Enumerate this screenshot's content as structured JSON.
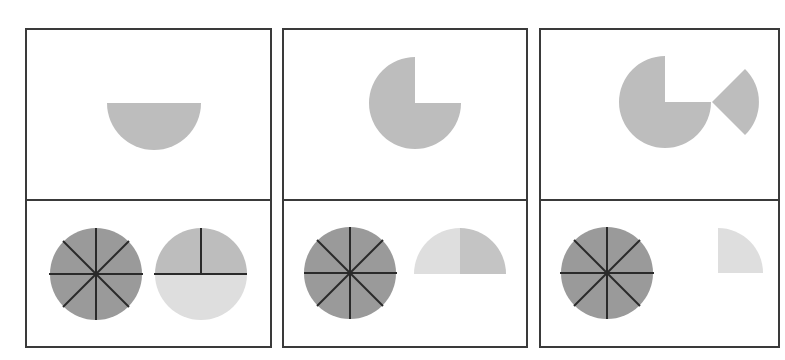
{
  "diagram": {
    "colors": {
      "background": "#ffffff",
      "border": "#3a3a3a",
      "dark_fill": "#9a9a9a",
      "medium_fill": "#bdbdbd",
      "light_fill": "#dedede",
      "line": "#2a2a2a"
    },
    "panels": [
      {
        "id": 1,
        "top": {
          "shape": "half-circle",
          "fraction": "1/2"
        },
        "bottom": [
          {
            "shape": "circle-eighths",
            "fraction": "8/8"
          },
          {
            "shape": "circle-split",
            "upper": "medium (two quarters)",
            "lower": "light half"
          }
        ]
      },
      {
        "id": 2,
        "top": {
          "shape": "three-quarter-circle",
          "fraction": "3/4"
        },
        "bottom": [
          {
            "shape": "circle-eighths",
            "fraction": "8/8"
          },
          {
            "shape": "half-circle-split",
            "left": "light quarter",
            "right": "medium quarter"
          }
        ]
      },
      {
        "id": 3,
        "top": {
          "shape": "three-quarter-circle-plus-quarter-wedge",
          "fraction": "3/4 + 1/4"
        },
        "bottom": [
          {
            "shape": "circle-eighths",
            "fraction": "8/8"
          },
          {
            "shape": "quarter-circle",
            "fraction": "1/4"
          }
        ]
      }
    ]
  }
}
